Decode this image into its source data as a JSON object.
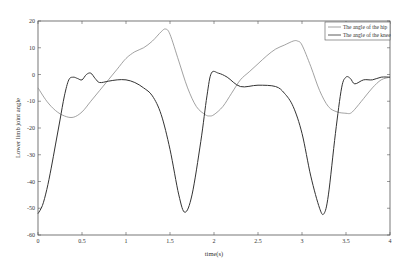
{
  "chart_data": {
    "type": "line",
    "title": "",
    "xlabel": "time(s)",
    "ylabel": "Lower limb joint angle",
    "xlim": [
      0,
      4
    ],
    "ylim": [
      -60,
      20
    ],
    "xticks": [
      0,
      0.5,
      1,
      1.5,
      2,
      2.5,
      3,
      3.5,
      4
    ],
    "xtick_labels": [
      "0",
      "0.5",
      "1",
      "1.5",
      "2",
      "2.5",
      "3",
      "3.5",
      "4"
    ],
    "yticks": [
      20,
      10,
      0,
      -10,
      -20,
      -30,
      -40,
      -50,
      -60
    ],
    "ytick_labels": [
      "20",
      "10",
      "0",
      "-10",
      "-20",
      "-30",
      "-40",
      "-50",
      "-60"
    ],
    "grid": false,
    "legend_position": "upper right",
    "series": [
      {
        "name": "The angle of the hip",
        "color": "#8a8a8a",
        "x": [
          0,
          0.1,
          0.2,
          0.3,
          0.4,
          0.5,
          0.6,
          0.7,
          0.8,
          0.9,
          1.0,
          1.1,
          1.2,
          1.3,
          1.4,
          1.45,
          1.5,
          1.6,
          1.7,
          1.8,
          1.9,
          1.95,
          2.0,
          2.1,
          2.2,
          2.3,
          2.4,
          2.5,
          2.6,
          2.7,
          2.8,
          2.9,
          2.95,
          3.0,
          3.1,
          3.2,
          3.3,
          3.4,
          3.5,
          3.55,
          3.6,
          3.7,
          3.8,
          3.9,
          4.0
        ],
        "values": [
          -5,
          -10,
          -13.5,
          -15.5,
          -16,
          -14,
          -10,
          -6,
          -2,
          2,
          6,
          8.5,
          10,
          12.5,
          16,
          17,
          15,
          5,
          -5,
          -12,
          -15,
          -15.5,
          -15,
          -12,
          -7,
          -2,
          1,
          4,
          7,
          9.5,
          11,
          12.5,
          12.5,
          11,
          3,
          -6,
          -12,
          -14,
          -14.5,
          -14.5,
          -13,
          -9,
          -5,
          -2,
          -1
        ]
      },
      {
        "name": "The angle of the knee",
        "color": "#333333",
        "x": [
          0,
          0.05,
          0.1,
          0.15,
          0.2,
          0.25,
          0.3,
          0.35,
          0.4,
          0.45,
          0.5,
          0.55,
          0.6,
          0.65,
          0.7,
          0.8,
          0.9,
          1.0,
          1.1,
          1.2,
          1.3,
          1.4,
          1.5,
          1.6,
          1.67,
          1.75,
          1.85,
          1.92,
          1.97,
          2.05,
          2.15,
          2.3,
          2.5,
          2.7,
          2.8,
          2.9,
          3.0,
          3.1,
          3.2,
          3.25,
          3.3,
          3.38,
          3.45,
          3.5,
          3.55,
          3.6,
          3.7,
          3.8,
          3.9,
          4.0
        ],
        "values": [
          -52,
          -49,
          -43,
          -35,
          -26,
          -17,
          -8,
          -2,
          -1,
          -1.5,
          -2,
          0,
          0.5,
          -1.5,
          -3,
          -2.5,
          -2,
          -2,
          -3,
          -5,
          -8,
          -15,
          -28,
          -45,
          -51.5,
          -45,
          -25,
          -8,
          0.5,
          0.5,
          -1,
          -4.5,
          -4,
          -4.5,
          -7,
          -12,
          -22,
          -38,
          -50,
          -52,
          -45,
          -22,
          -5,
          -1,
          -1.5,
          -3.5,
          -2,
          -2,
          -1,
          -1
        ]
      }
    ]
  },
  "legend": {
    "items": [
      {
        "label": "The angle of the hip"
      },
      {
        "label": "The angle of the knee"
      }
    ]
  }
}
